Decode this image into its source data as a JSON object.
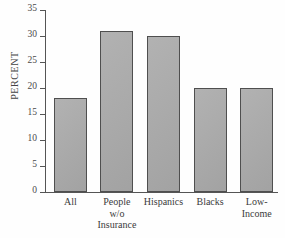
{
  "chart_data": {
    "type": "bar",
    "title": "",
    "subtitle": "",
    "xlabel": "",
    "ylabel": "PERCENT",
    "categories": [
      "All",
      "People\nw/o\nInsurance",
      "Hispanics",
      "Blacks",
      "Low-\nIncome"
    ],
    "category_labels_flat": [
      "All",
      "People w/o Insurance",
      "Hispanics",
      "Blacks",
      "Low-Income"
    ],
    "values": [
      18,
      31,
      30,
      20,
      20
    ],
    "value_unit": "percent",
    "ylim": [
      0,
      35
    ],
    "yticks": [
      0,
      5,
      10,
      15,
      20,
      25,
      30,
      35
    ],
    "ytick_labels": [
      "0",
      "5",
      "10",
      "15",
      "20",
      "25",
      "30",
      "35"
    ],
    "grid": false,
    "legend": null,
    "legend_position": "none",
    "annotations": [],
    "colors": {
      "bar_fill": "#a9a9a9",
      "bar_edge": "#4f4f4f",
      "axis": "#555555",
      "text": "#3b3b3b",
      "background": "#fefefe"
    }
  }
}
